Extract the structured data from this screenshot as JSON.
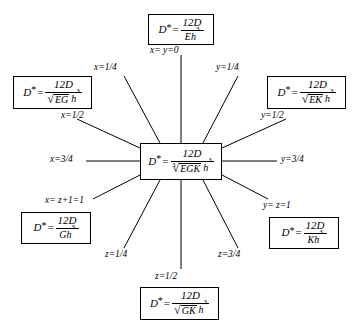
{
  "figure": {
    "center": {
      "lhs": "D",
      "star": "*",
      "equals": "=",
      "numerator": "12D",
      "radical_index": "3",
      "radical_symbol": "√",
      "radicand": "EGK",
      "denominator_rest": "h",
      "denominator_exponent": "3"
    },
    "boxes": [
      {
        "id": "top",
        "lhs": "D",
        "star": "*",
        "equals": "=",
        "numerator": "12D",
        "radical_index": "",
        "radical_symbol": "",
        "radicand": "",
        "denominator_rest": "Eh",
        "denominator_exponent": "3"
      },
      {
        "id": "left-upper",
        "lhs": "D",
        "star": "*",
        "equals": "=",
        "numerator": "12D",
        "radical_index": "",
        "radical_symbol": "√",
        "radicand": "EG",
        "denominator_rest": "h",
        "denominator_exponent": "3"
      },
      {
        "id": "right-upper",
        "lhs": "D",
        "star": "*",
        "equals": "=",
        "numerator": "12D",
        "radical_index": "",
        "radical_symbol": "√",
        "radicand": "EK",
        "denominator_rest": "h",
        "denominator_exponent": "3"
      },
      {
        "id": "left-lower",
        "lhs": "D",
        "star": "*",
        "equals": "=",
        "numerator": "12D",
        "radical_index": "",
        "radical_symbol": "",
        "radicand": "",
        "denominator_rest": "Gh",
        "denominator_exponent": "3"
      },
      {
        "id": "right-lower",
        "lhs": "D",
        "star": "*",
        "equals": "=",
        "numerator": "12D",
        "radical_index": "",
        "radical_symbol": "",
        "radicand": "",
        "denominator_rest": "Kh",
        "denominator_exponent": "3"
      },
      {
        "id": "bottom",
        "lhs": "D",
        "star": "*",
        "equals": "=",
        "numerator": "12D",
        "radical_index": "",
        "radical_symbol": "√",
        "radicand": "GK",
        "denominator_rest": "h",
        "denominator_exponent": "3"
      }
    ],
    "ray_labels": [
      {
        "id": "top",
        "text": "x= y=0"
      },
      {
        "id": "up-left",
        "text": "x=1/4"
      },
      {
        "id": "up-right",
        "text": "y=1/4"
      },
      {
        "id": "left-upper",
        "text": "x=1/2"
      },
      {
        "id": "right-upper",
        "text": "y=1/2"
      },
      {
        "id": "left",
        "text": "x=3/4"
      },
      {
        "id": "right",
        "text": "y=3/4"
      },
      {
        "id": "left-lower",
        "text": "x= z+1=1"
      },
      {
        "id": "right-lower",
        "text": "y= z=1"
      },
      {
        "id": "down-left",
        "text": "z=1/4"
      },
      {
        "id": "down-right",
        "text": "z=3/4"
      },
      {
        "id": "bottom",
        "text": "z=1/2"
      }
    ]
  }
}
